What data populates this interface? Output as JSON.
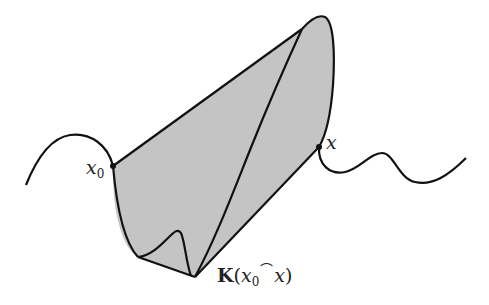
{
  "diagram": {
    "colors": {
      "stroke": "#111111",
      "fill": "#c4c4c4",
      "background": "#ffffff"
    },
    "labels": {
      "x0_var": "x",
      "x0_sub": "0",
      "x_var": "x",
      "k_symbol": "K",
      "k_open": "(",
      "k_var1": "x",
      "k_sub": "0",
      "k_arc": "⌒",
      "k_var2": "x",
      "k_close": ")"
    },
    "points": [
      {
        "name": "x0",
        "x": 113,
        "y": 166
      },
      {
        "name": "x",
        "x": 319,
        "y": 147
      }
    ]
  }
}
